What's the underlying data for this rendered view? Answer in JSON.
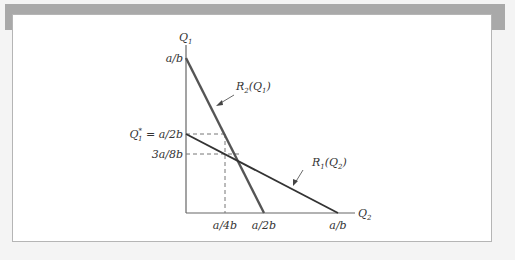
{
  "figure": {
    "axes": {
      "y_label": "Q",
      "y_label_sub": "1",
      "x_label": "Q",
      "x_label_sub": "2"
    },
    "y_ticks": [
      {
        "label": "a/b"
      },
      {
        "label_main": "Q",
        "label_sub": "1",
        "label_sup": "*",
        "label_rest": " = a/2b"
      },
      {
        "label": "3a/8b"
      }
    ],
    "x_ticks": [
      {
        "label": "a/4b"
      },
      {
        "label": "a/2b"
      },
      {
        "label": "a/b"
      }
    ],
    "curves": [
      {
        "name": "R",
        "sub": "2",
        "arg": "Q",
        "arg_sub": "1"
      },
      {
        "name": "R",
        "sub": "1",
        "arg": "Q",
        "arg_sub": "2"
      }
    ],
    "colors": {
      "reaction_line_R2": "#555555",
      "reaction_line_R1": "#333333",
      "axis": "#666666",
      "dashed": "#777777",
      "frame_band": "#a9a9a9",
      "background": "#f4f4f4"
    }
  }
}
